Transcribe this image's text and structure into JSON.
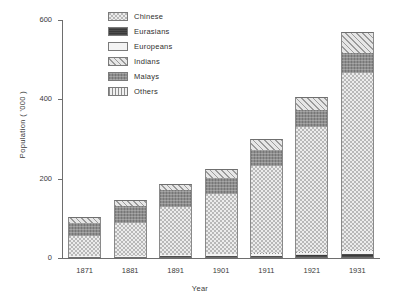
{
  "chart_data": {
    "type": "bar",
    "subtype": "stacked-vertical",
    "title": "",
    "xlabel": "Year",
    "ylabel": "Population ( '000 )",
    "categories": [
      "1871",
      "1881",
      "1891",
      "1901",
      "1911",
      "1921",
      "1931"
    ],
    "ylim": [
      0,
      600
    ],
    "yticks": [
      0,
      200,
      400,
      600
    ],
    "ytick_labels": [
      "0",
      "200",
      "400",
      "600"
    ],
    "grid": false,
    "legend_position": "top-center",
    "series": [
      {
        "name": "Chinese",
        "pattern": "light-dotted",
        "values": [
          50,
          83,
          121,
          151,
          219,
          315,
          446
        ]
      },
      {
        "name": "Eurasians",
        "pattern": "solid-dark",
        "values": [
          2,
          3,
          4,
          5,
          6,
          7,
          9
        ]
      },
      {
        "name": "Europeans",
        "pattern": "very-light-stipple",
        "values": [
          2,
          2,
          3,
          4,
          5,
          6,
          8
        ]
      },
      {
        "name": "Indians",
        "pattern": "diagonal-hatch",
        "values": [
          15,
          13,
          15,
          23,
          28,
          33,
          55
        ]
      },
      {
        "name": "Malays",
        "pattern": "gray-crosshatch",
        "values": [
          33,
          43,
          43,
          40,
          40,
          43,
          50
        ]
      },
      {
        "name": "Others",
        "pattern": "vertical-lines",
        "values": [
          1,
          1,
          1,
          2,
          2,
          2,
          3
        ]
      }
    ],
    "totals": [
      103,
      145,
      187,
      225,
      300,
      406,
      571
    ]
  },
  "legend": {
    "items": [
      {
        "label": "Chinese"
      },
      {
        "label": "Eurasians"
      },
      {
        "label": "Europeans"
      },
      {
        "label": "Indians"
      },
      {
        "label": "Malays"
      },
      {
        "label": "Others"
      }
    ]
  },
  "axes": {
    "y_title": "Population ( '000 )",
    "x_title": "Year"
  },
  "colors": {
    "chinese": "#ececec",
    "eurasians": "#3a3a3a",
    "europeans": "#f3f3f3",
    "indians": "#e6e6e6",
    "malays": "#8d8d8d",
    "others": "#f0f0f0",
    "axis": "#6e6e6e",
    "text": "#2f2f2f",
    "background": "#ffffff"
  }
}
